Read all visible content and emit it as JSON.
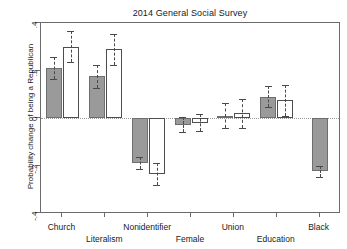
{
  "chart_data": {
    "type": "bar",
    "title": "2014 General Social Survey",
    "xlabel": "",
    "ylabel": "Probability change of being a Republican",
    "ylim": [
      -0.4,
      0.4
    ],
    "yticks": [
      0.4,
      0.2,
      0,
      -0.2,
      -0.4
    ],
    "ytick_labels": [
      ".4",
      ".2",
      "0",
      "-.2",
      "-.4"
    ],
    "grid": "zero-line-only",
    "legend": "none",
    "categories": [
      "Church",
      "Literalism",
      "Nonidentifier",
      "Female",
      "Union",
      "Education",
      "Black"
    ],
    "series": [
      {
        "name": "Model 1",
        "style": "filled-gray",
        "color": "#9a9a9a",
        "values": [
          0.21,
          0.175,
          -0.19,
          -0.03,
          0.01,
          0.09,
          -0.225
        ],
        "ci_low": [
          0.165,
          0.125,
          -0.215,
          -0.06,
          -0.04,
          0.045,
          -0.25
        ],
        "ci_high": [
          0.255,
          0.225,
          -0.165,
          0.005,
          0.065,
          0.135,
          -0.2
        ]
      },
      {
        "name": "Model 2",
        "style": "hollow-white",
        "color": "#ffffff",
        "values": [
          0.3,
          0.29,
          -0.235,
          -0.02,
          0.02,
          0.075,
          null
        ],
        "ci_low": [
          0.235,
          0.225,
          -0.28,
          -0.055,
          -0.04,
          0.01,
          null
        ],
        "ci_high": [
          0.365,
          0.355,
          -0.19,
          0.015,
          0.08,
          0.14,
          null
        ]
      }
    ],
    "annotations": []
  },
  "axis": {
    "title": "2014 General Social Survey",
    "y_title": "Probability change of being a Republican"
  }
}
